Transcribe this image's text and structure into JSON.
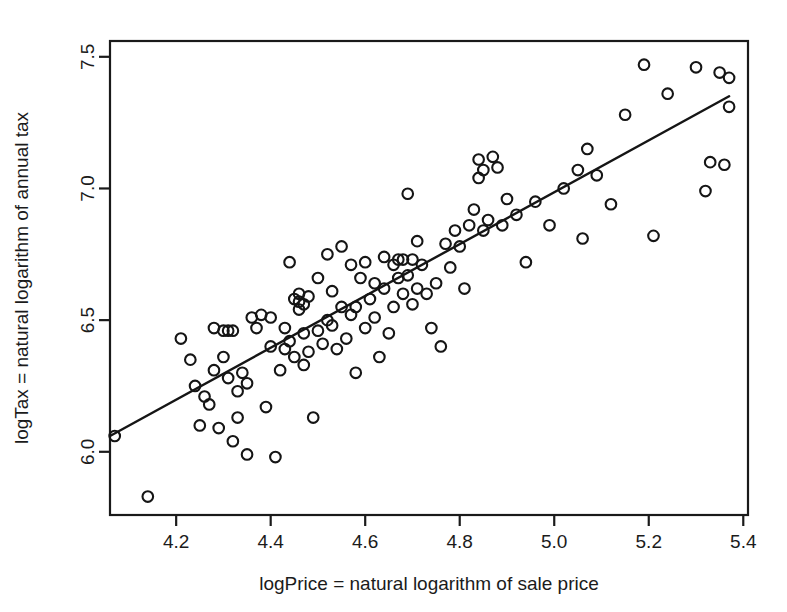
{
  "chart_data": {
    "type": "scatter",
    "title": "",
    "xlabel": "logPrice = natural logarithm of sale price",
    "ylabel": "logTax = natural logarithm of annual tax",
    "xlim": [
      4.06,
      5.41
    ],
    "ylim": [
      5.76,
      7.56
    ],
    "xticks": [
      4.2,
      4.4,
      4.6,
      4.8,
      5.0,
      5.2,
      5.4
    ],
    "xtick_labels": [
      "4.2",
      "4.4",
      "4.6",
      "4.8",
      "5.0",
      "5.2",
      "5.4"
    ],
    "yticks": [
      6.0,
      6.5,
      7.0,
      7.5
    ],
    "ytick_labels": [
      "6.0",
      "6.5",
      "7.0",
      "7.5"
    ],
    "grid": false,
    "legend": "none",
    "marker": "open-circle",
    "marker_color": "#151515",
    "series": [
      {
        "name": "houses",
        "x": [
          4.07,
          4.14,
          4.21,
          4.23,
          4.24,
          4.25,
          4.26,
          4.27,
          4.28,
          4.28,
          4.29,
          4.3,
          4.3,
          4.31,
          4.31,
          4.32,
          4.32,
          4.33,
          4.33,
          4.34,
          4.35,
          4.35,
          4.36,
          4.37,
          4.38,
          4.39,
          4.4,
          4.4,
          4.41,
          4.42,
          4.43,
          4.43,
          4.44,
          4.44,
          4.45,
          4.45,
          4.46,
          4.46,
          4.46,
          4.47,
          4.47,
          4.47,
          4.48,
          4.48,
          4.49,
          4.5,
          4.5,
          4.51,
          4.52,
          4.52,
          4.53,
          4.53,
          4.54,
          4.55,
          4.55,
          4.56,
          4.57,
          4.57,
          4.58,
          4.58,
          4.59,
          4.6,
          4.6,
          4.61,
          4.62,
          4.62,
          4.63,
          4.64,
          4.64,
          4.65,
          4.66,
          4.66,
          4.67,
          4.67,
          4.68,
          4.68,
          4.69,
          4.69,
          4.7,
          4.7,
          4.71,
          4.71,
          4.72,
          4.73,
          4.74,
          4.75,
          4.76,
          4.77,
          4.78,
          4.79,
          4.8,
          4.81,
          4.82,
          4.83,
          4.84,
          4.84,
          4.85,
          4.85,
          4.86,
          4.87,
          4.88,
          4.89,
          4.9,
          4.92,
          4.94,
          4.96,
          4.99,
          5.02,
          5.05,
          5.06,
          5.07,
          5.09,
          5.12,
          5.15,
          5.19,
          5.21,
          5.24,
          5.3,
          5.32,
          5.33,
          5.35,
          5.36,
          5.37,
          5.37
        ],
        "y": [
          6.06,
          5.83,
          6.43,
          6.35,
          6.25,
          6.1,
          6.21,
          6.18,
          6.31,
          6.47,
          6.09,
          6.36,
          6.46,
          6.28,
          6.46,
          6.04,
          6.46,
          6.13,
          6.23,
          6.3,
          5.99,
          6.26,
          6.51,
          6.47,
          6.52,
          6.17,
          6.4,
          6.51,
          5.98,
          6.31,
          6.39,
          6.47,
          6.42,
          6.72,
          6.36,
          6.58,
          6.54,
          6.57,
          6.6,
          6.33,
          6.45,
          6.56,
          6.38,
          6.59,
          6.13,
          6.46,
          6.66,
          6.41,
          6.5,
          6.75,
          6.48,
          6.61,
          6.39,
          6.55,
          6.78,
          6.43,
          6.52,
          6.71,
          6.3,
          6.55,
          6.66,
          6.47,
          6.72,
          6.58,
          6.51,
          6.64,
          6.36,
          6.62,
          6.74,
          6.45,
          6.55,
          6.71,
          6.66,
          6.73,
          6.6,
          6.73,
          6.67,
          6.98,
          6.56,
          6.73,
          6.62,
          6.8,
          6.71,
          6.6,
          6.47,
          6.64,
          6.4,
          6.79,
          6.7,
          6.84,
          6.78,
          6.62,
          6.86,
          6.92,
          7.04,
          7.11,
          6.84,
          7.07,
          6.88,
          7.12,
          7.08,
          6.86,
          6.96,
          6.9,
          6.72,
          6.95,
          6.86,
          7.0,
          7.07,
          6.81,
          7.15,
          7.05,
          6.94,
          7.28,
          7.47,
          6.82,
          7.36,
          7.46,
          6.99,
          7.1,
          7.44,
          7.09,
          7.42,
          7.31
        ]
      }
    ],
    "fit_line": {
      "type": "linear-regression",
      "x_start": 4.06,
      "y_start": 6.06,
      "x_end": 5.37,
      "y_end": 7.35
    }
  }
}
